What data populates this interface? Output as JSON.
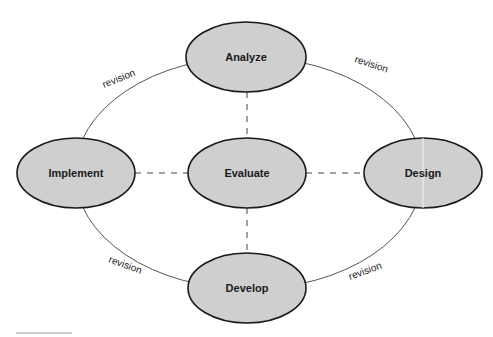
{
  "diagram": {
    "type": "cycle",
    "colors": {
      "node_fill": "#cfcfcf",
      "node_stroke": "#1a1a1a",
      "cycle_stroke": "#555555",
      "dash_stroke": "#444444"
    },
    "nodes": [
      {
        "id": "analyze",
        "label": "Analyze"
      },
      {
        "id": "design",
        "label": "Design"
      },
      {
        "id": "develop",
        "label": "Develop"
      },
      {
        "id": "implement",
        "label": "Implement"
      },
      {
        "id": "evaluate",
        "label": "Evaluate"
      }
    ],
    "edges": [
      {
        "from": "analyze",
        "to": "design",
        "label": "revision",
        "style": "solid"
      },
      {
        "from": "design",
        "to": "develop",
        "label": "revision",
        "style": "solid"
      },
      {
        "from": "develop",
        "to": "implement",
        "label": "revision",
        "style": "solid"
      },
      {
        "from": "implement",
        "to": "analyze",
        "label": "revision",
        "style": "solid"
      },
      {
        "from": "evaluate",
        "to": "analyze",
        "label": "",
        "style": "dashed"
      },
      {
        "from": "evaluate",
        "to": "design",
        "label": "",
        "style": "dashed"
      },
      {
        "from": "evaluate",
        "to": "develop",
        "label": "",
        "style": "dashed"
      },
      {
        "from": "evaluate",
        "to": "implement",
        "label": "",
        "style": "dashed"
      }
    ]
  }
}
